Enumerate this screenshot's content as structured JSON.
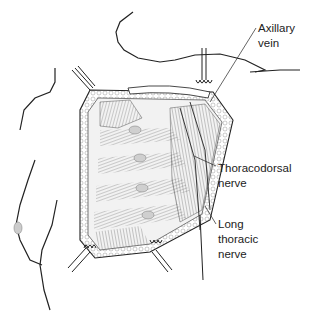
{
  "figure": {
    "colors": {
      "line": "#222222",
      "hatch": "#6a6a6a",
      "background": "#ffffff",
      "tissue_fill": "#e8e8e8"
    }
  },
  "labels": [
    {
      "id": "axillary-vein",
      "lines": [
        "Axillary",
        "vein"
      ]
    },
    {
      "id": "thoracodorsal-nerve",
      "lines": [
        "Thoracodorsal",
        "nerve"
      ]
    },
    {
      "id": "long-thoracic-nerve",
      "lines": [
        "Long",
        "thoracic",
        "nerve"
      ]
    }
  ]
}
